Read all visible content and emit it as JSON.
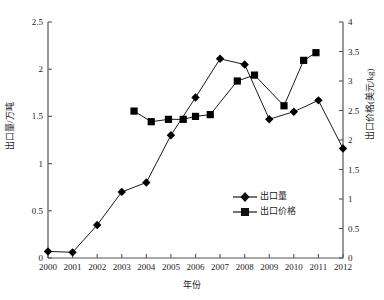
{
  "chart_data": {
    "type": "line",
    "title": "",
    "xlabel": "年份",
    "ylabel": "出口量/万吨",
    "y2label": "出口价格(美元/kg)",
    "x": [
      2000,
      2001,
      2002,
      2003,
      2004,
      2005,
      2006,
      2007,
      2008,
      2009,
      2010,
      2011,
      2012
    ],
    "categories": [
      "2000",
      "2001",
      "2002",
      "2003",
      "2004",
      "2005",
      "2006",
      "2007",
      "2008",
      "2009",
      "2010",
      "2011",
      "2012"
    ],
    "xlim": [
      2000,
      2012
    ],
    "ylim": [
      0,
      2.5
    ],
    "y2lim": [
      0,
      4
    ],
    "yticks": [
      "0",
      "0.5",
      "1",
      "1.5",
      "2",
      "2.5"
    ],
    "ytick_values": [
      0,
      0.5,
      1,
      1.5,
      2,
      2.5
    ],
    "y2ticks": [
      "0",
      "0.5",
      "1",
      "1.5",
      "2",
      "2.5",
      "3",
      "3.5",
      "4"
    ],
    "y2tick_values": [
      0,
      0.5,
      1,
      1.5,
      2,
      2.5,
      3,
      3.5,
      4
    ],
    "grid": false,
    "legend_position": "lower-right",
    "series": [
      {
        "name": "出口量",
        "axis": "left",
        "marker": "diamond",
        "color": "#000000",
        "x": [
          2000,
          2001,
          2002,
          2003,
          2004,
          2005,
          2006,
          2007,
          2008,
          2009,
          2010,
          2011,
          2012
        ],
        "values": [
          0.07,
          0.06,
          0.35,
          0.7,
          0.8,
          1.3,
          1.7,
          2.11,
          2.05,
          1.47,
          1.55,
          1.67,
          1.16
        ]
      },
      {
        "name": "出口价格",
        "axis": "right",
        "marker": "square",
        "color": "#000000",
        "x": [
          2003.5,
          2004.2,
          2004.9,
          2005.5,
          2006.0,
          2006.6,
          2007.7,
          2008.4,
          2009.6,
          2010.4,
          2010.9
        ],
        "values": [
          2.49,
          2.31,
          2.35,
          2.35,
          2.4,
          2.43,
          3.0,
          3.1,
          2.58,
          3.35,
          3.48
        ]
      }
    ]
  },
  "legend": {
    "items": [
      {
        "label": "出口量",
        "marker": "diamond"
      },
      {
        "label": "出口价格",
        "marker": "square"
      }
    ]
  }
}
